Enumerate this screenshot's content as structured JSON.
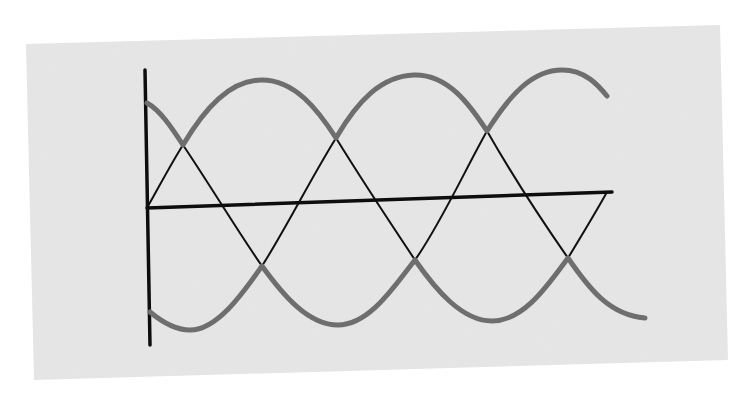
{
  "diagram": {
    "colors": {
      "page_background": "#ffffff",
      "panel": "#e6e6e6",
      "envelope": "#6e6e6e",
      "thin_lines": "#111111",
      "axes": "#0d0d0d"
    },
    "panel": {
      "points": "26,44 720,25 728,360 34,380"
    },
    "axes": {
      "vertical": {
        "x1": 145,
        "y1": 70,
        "x2": 150,
        "y2": 345
      },
      "horizontal": {
        "x1": 147,
        "y1": 208,
        "x2": 612,
        "y2": 192
      }
    },
    "upper_envelope": {
      "path": "M147,103 C160,110 172,128 183,145 C205,108 230,80 262,80 C295,80 318,110 336,138 C358,100 382,76 414,75 C448,74 470,105 487,131 C510,95 532,70 562,70 C585,70 598,85 607,96"
    },
    "lower_envelope": {
      "path": "M150,312 C162,322 175,330 190,330 C218,330 245,290 262,266 C283,295 308,325 338,325 C370,325 395,285 415,260 C436,290 462,321 492,321 C524,321 548,285 568,258 C590,290 610,315 645,318"
    },
    "thin_segments": [
      "M147,208 C160,185 172,162 183,145",
      "M183,145 C210,185 240,235 262,266",
      "M262,266 C285,230 310,180 336,138",
      "M336,138 C365,185 395,230 415,260",
      "M415,260 C440,225 465,170 487,131",
      "M487,131 C515,180 545,225 568,258",
      "M568,258 C582,235 597,210 607,192"
    ]
  }
}
